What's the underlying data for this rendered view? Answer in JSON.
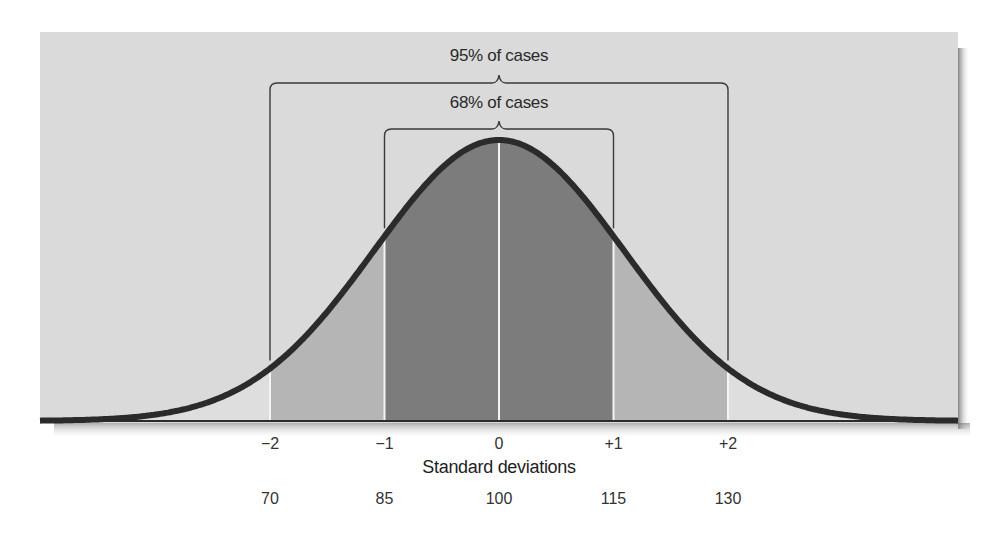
{
  "chart_data": {
    "type": "area",
    "title": "",
    "xlabel": "Standard deviations",
    "ylabel": "",
    "grid": false,
    "legend": null,
    "x_sd_ticks": [
      "−2",
      "−1",
      "0",
      "+1",
      "+2"
    ],
    "x_sd_values": [
      -2,
      -1,
      0,
      1,
      2
    ],
    "x_score_ticks": [
      "70",
      "85",
      "100",
      "115",
      "130"
    ],
    "x_score_values": [
      70,
      85,
      100,
      115,
      130
    ],
    "mean": 100,
    "sd": 15,
    "xlim_sd": [
      -4,
      4
    ],
    "regions": [
      {
        "name": "tail-left",
        "from_sd": -4,
        "to_sd": -2,
        "shade": "#dedede"
      },
      {
        "name": "band-left",
        "from_sd": -2,
        "to_sd": -1,
        "shade": "#b5b5b5"
      },
      {
        "name": "center-left",
        "from_sd": -1,
        "to_sd": 0,
        "shade": "#7c7c7c"
      },
      {
        "name": "center-right",
        "from_sd": 0,
        "to_sd": 1,
        "shade": "#7c7c7c"
      },
      {
        "name": "band-right",
        "from_sd": 1,
        "to_sd": 2,
        "shade": "#b5b5b5"
      },
      {
        "name": "tail-right",
        "from_sd": 2,
        "to_sd": 4,
        "shade": "#dedede"
      }
    ],
    "annotations": [
      {
        "label": "95% of cases",
        "from_sd": -2,
        "to_sd": 2,
        "percent": 95
      },
      {
        "label": "68% of cases",
        "from_sd": -1,
        "to_sd": 1,
        "percent": 68
      }
    ]
  },
  "figure": {
    "panel_color": "#dadada",
    "curve_color": "#2b2b2b",
    "separator_color": "#f4f4f4",
    "bracket_color": "#3a3a3a",
    "layout": {
      "panel": {
        "x": 40,
        "y": 32,
        "w": 918,
        "h": 391
      },
      "baseline_y": 421,
      "center_x": 499,
      "px_per_sd": 114.5,
      "peak_y": 140,
      "curve_sigma_px": 125,
      "bracket_outer_y": 83,
      "bracket_inner_y": 129,
      "bracket_outer_label_y": 46,
      "bracket_inner_label_y": 93
    }
  },
  "labels": {
    "bracket_outer": "95% of cases",
    "bracket_inner": "68% of cases",
    "axis_title": "Standard deviations",
    "sd_ticks": [
      "−2",
      "−1",
      "0",
      "+1",
      "+2"
    ],
    "score_ticks": [
      "70",
      "85",
      "100",
      "115",
      "130"
    ]
  }
}
